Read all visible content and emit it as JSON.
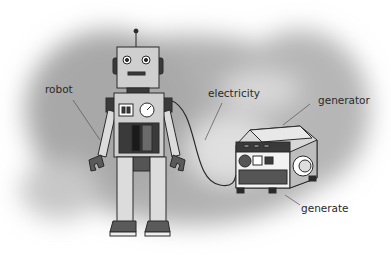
{
  "diagram": {
    "labels": {
      "robot": "robot",
      "electricity": "electricity",
      "generator": "generator",
      "generate": "generate"
    },
    "colors": {
      "background_cloud": "#b4b4b4",
      "robot_body": "#cfcfcf",
      "dark_parts": "#3a3a3a",
      "label_text": "#2a2a2a"
    }
  }
}
